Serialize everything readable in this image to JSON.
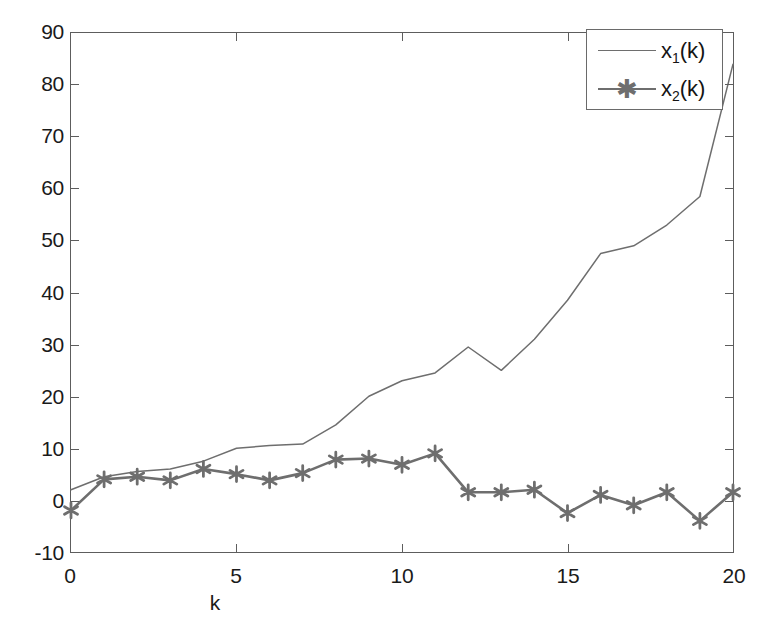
{
  "figure": {
    "background_color": "#ffffff",
    "axis_color": "#5d5d5d",
    "series_color": "#6e6e6e"
  },
  "axes": {
    "x_axis_title": "k",
    "y_axis_title": "",
    "x_ticks": [
      "0",
      "5",
      "10",
      "15",
      "20"
    ],
    "y_ticks": [
      "-10",
      "0",
      "10",
      "20",
      "30",
      "40",
      "50",
      "60",
      "70",
      "80",
      "90"
    ]
  },
  "legend": {
    "position": "top-right",
    "entries": [
      {
        "label_main": "x",
        "label_sub": "1",
        "label_tail": "(k)",
        "marker": "none",
        "line": "thin"
      },
      {
        "label_main": "x",
        "label_sub": "2",
        "label_tail": "(k)",
        "marker": "asterisk-marker",
        "line": "thick"
      }
    ]
  },
  "chart_data": {
    "type": "line",
    "title": "",
    "xlabel": "k",
    "ylabel": "",
    "xlim": [
      0,
      20
    ],
    "ylim": [
      -10,
      90
    ],
    "grid": false,
    "legend_position": "upper right",
    "x": [
      0,
      1,
      2,
      3,
      4,
      5,
      6,
      7,
      8,
      9,
      10,
      11,
      12,
      13,
      14,
      15,
      16,
      17,
      18,
      19,
      20
    ],
    "series": [
      {
        "name": "x_1(k)",
        "display_name": "x1(k)",
        "marker": "none",
        "linewidth": 1.5,
        "color": "#6e6e6e",
        "values": [
          2,
          4.5,
          5.5,
          6,
          7.5,
          10,
          10.5,
          10.8,
          14.5,
          20,
          23,
          24.5,
          29.5,
          25,
          31,
          38.5,
          47.5,
          49,
          53,
          58.5,
          84
        ]
      },
      {
        "name": "x_2(k)",
        "display_name": "x2(k)",
        "marker": "asterisk",
        "linewidth": 2.6,
        "color": "#6e6e6e",
        "values": [
          -2,
          4,
          4.5,
          3.8,
          6,
          5,
          3.8,
          5.2,
          7.8,
          8,
          6.8,
          9,
          1.5,
          1.5,
          2,
          -2.5,
          1,
          -1,
          1.5,
          -4,
          1.5
        ]
      }
    ]
  }
}
